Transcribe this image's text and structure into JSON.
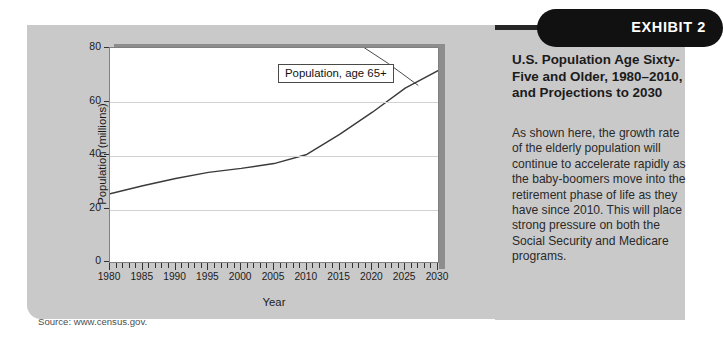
{
  "exhibit": {
    "badge_label": "EXHIBIT 2",
    "title": "U.S. Population Age Sixty-Five and Older, 1980–2010, and Projections to 2030",
    "body": "As shown here, the growth rate of the elderly population will continue to accelerate rapidly as the baby-boomers move into the retirement phase of life as they have since 2010. This will place strong pressure on both the Social Security and Medicare programs.",
    "source": "Source: www.census.gov."
  },
  "colors": {
    "card_background": "#c9c9c9",
    "badge_background": "#111111",
    "badge_text": "#ffffff",
    "plot_background": "#ffffff",
    "plot_shadow": "#8d8d8d",
    "gridline": "#d2d2d2",
    "series_line": "#3a3a3a",
    "top_rule": "#262626"
  },
  "chart_data": {
    "type": "line",
    "title": "",
    "xlabel": "Year",
    "ylabel": "Population (millions)",
    "xlim": [
      1980,
      2030
    ],
    "ylim": [
      0,
      80
    ],
    "yticks": [
      0,
      20,
      40,
      60,
      80
    ],
    "xticks": [
      1980,
      1985,
      1990,
      1995,
      2000,
      2005,
      2010,
      2015,
      2020,
      2025,
      2030
    ],
    "minor_x_tick_interval": 1,
    "grid": "horizontal",
    "legend_position": "inside-callout",
    "annotations": [
      {
        "text": "Population, age 65+",
        "points_to_year": 2027,
        "points_to_value": 66
      }
    ],
    "series": [
      {
        "name": "Population, age 65+",
        "x": [
          1980,
          1985,
          1990,
          1995,
          2000,
          2005,
          2010,
          2015,
          2020,
          2025,
          2030
        ],
        "values": [
          25.5,
          28.5,
          31.2,
          33.5,
          35.0,
          36.8,
          40.2,
          47.7,
          56.0,
          65.0,
          71.5
        ]
      }
    ]
  }
}
